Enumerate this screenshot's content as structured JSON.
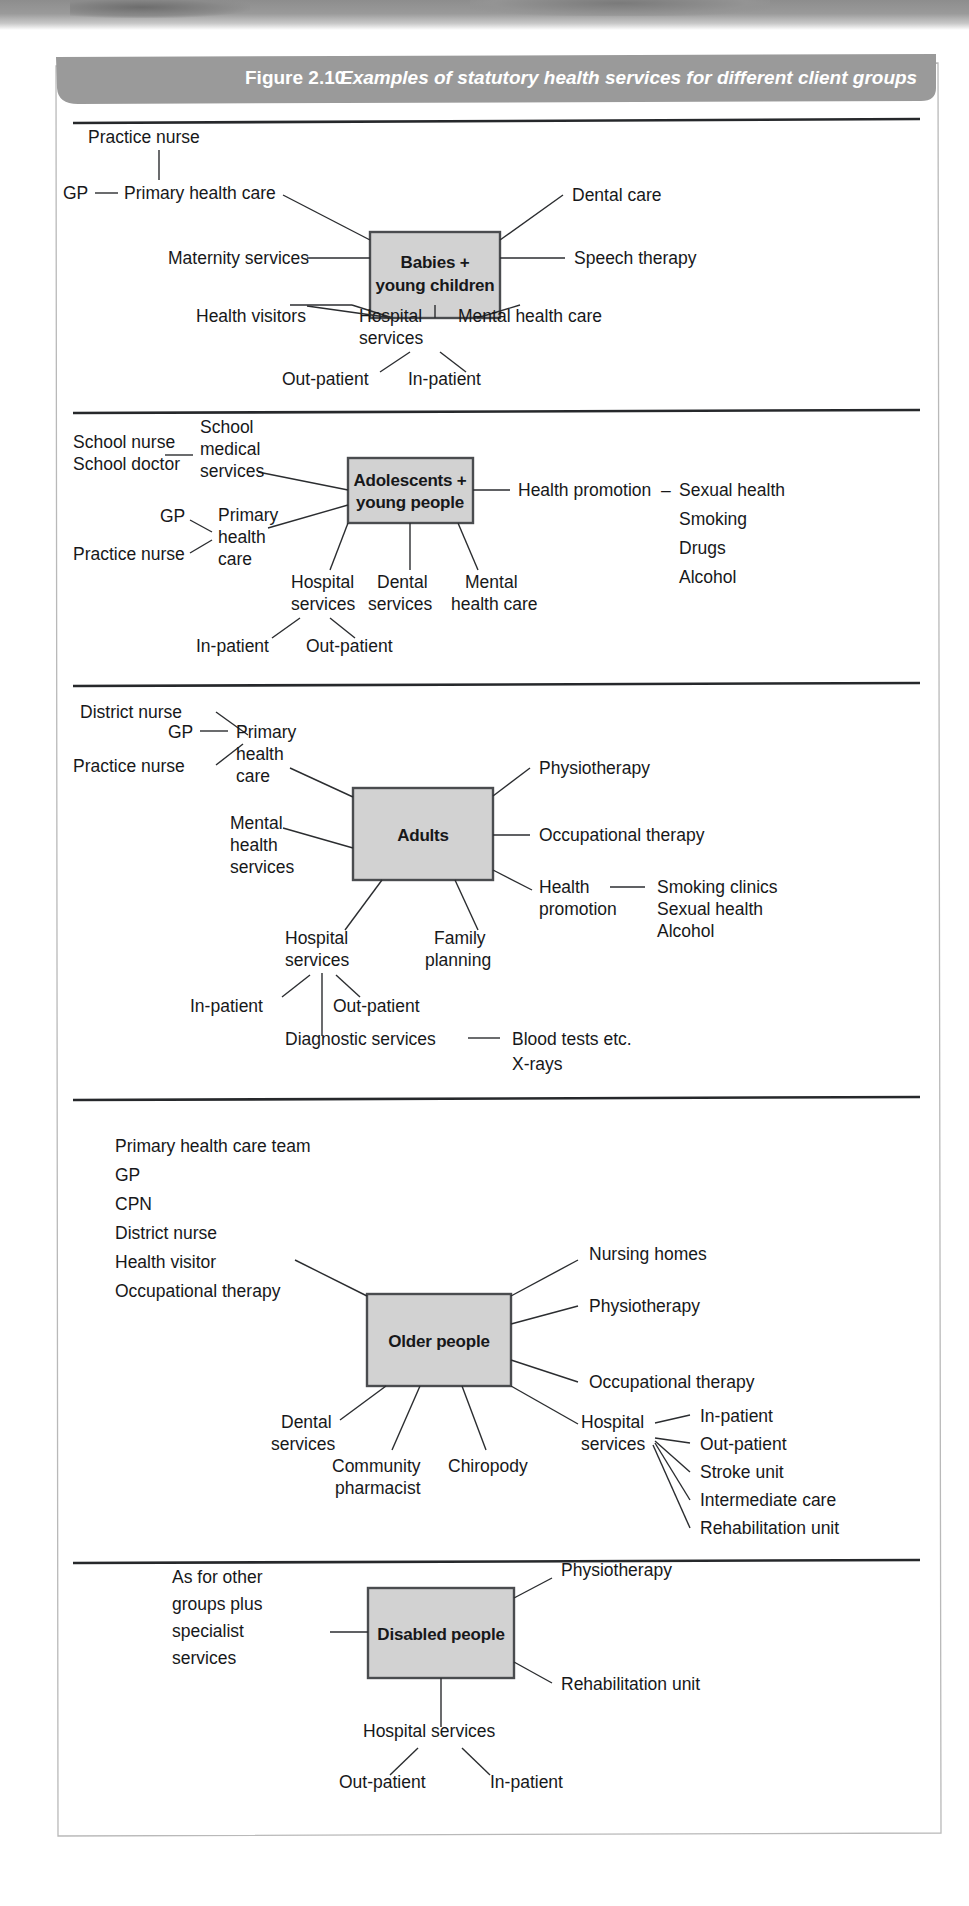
{
  "figure": {
    "number": "Figure 2.10",
    "title": "Examples of statutory health services for different client groups"
  },
  "colors": {
    "banner": "#9a9a9a",
    "box_fill": "#d2d2d2",
    "box_stroke": "#4a4c4f",
    "line": "#2b2d30",
    "rule": "#26282b",
    "page_border": "#b9b9b9"
  },
  "sections": [
    {
      "id": "babies",
      "center": "Babies +\nyoung children",
      "center_line1": "Babies +",
      "center_line2": "young children",
      "labels": {
        "practice_nurse": "Practice nurse",
        "gp": "GP",
        "primary_health_care": "Primary health care",
        "maternity_services": "Maternity services",
        "dental_care": "Dental care",
        "speech_therapy": "Speech therapy",
        "health_visitors": "Health visitors",
        "hospital_services_l1": "Hospital",
        "hospital_services_l2": "services",
        "mental_health_care": "Mental health care",
        "out_patient": "Out-patient",
        "in_patient": "In-patient"
      }
    },
    {
      "id": "adolescents",
      "center_line1": "Adolescents +",
      "center_line2": "young people",
      "labels": {
        "school_nurse": "School nurse",
        "school_doctor": "School doctor",
        "school_medical_l1": "School",
        "school_medical_l2": "medical",
        "school_medical_l3": "services",
        "gp": "GP",
        "practice_nurse": "Practice nurse",
        "primary_l1": "Primary",
        "primary_l2": "health",
        "primary_l3": "care",
        "health_promotion": "Health promotion",
        "dash": "–",
        "sexual_health": "Sexual health",
        "smoking": "Smoking",
        "drugs": "Drugs",
        "alcohol": "Alcohol",
        "hospital_l1": "Hospital",
        "hospital_l2": "services",
        "dental_l1": "Dental",
        "dental_l2": "services",
        "mental_l1": "Mental",
        "mental_l2": "health care",
        "in_patient": "In-patient",
        "out_patient": "Out-patient"
      }
    },
    {
      "id": "adults",
      "center_line1": "Adults",
      "labels": {
        "district_nurse": "District nurse",
        "gp": "GP",
        "practice_nurse": "Practice nurse",
        "primary_l1": "Primary",
        "primary_l2": "health",
        "primary_l3": "care",
        "mental_l1": "Mental",
        "mental_l2": "health",
        "mental_l3": "services",
        "physiotherapy": "Physiotherapy",
        "occupational_therapy": "Occupational therapy",
        "health_promotion_l1": "Health",
        "health_promotion_l2": "promotion",
        "smoking_clinics": "Smoking clinics",
        "sexual_health": "Sexual health",
        "alcohol": "Alcohol",
        "hospital_l1": "Hospital",
        "hospital_l2": "services",
        "family_l1": "Family",
        "family_l2": "planning",
        "in_patient": "In-patient",
        "out_patient": "Out-patient",
        "diagnostic_services": "Diagnostic services",
        "blood_tests": "Blood tests etc.",
        "x_rays": "X-rays"
      }
    },
    {
      "id": "older",
      "center_line1": "Older people",
      "labels": {
        "primary_health_care_team": "Primary health care team",
        "gp": "GP",
        "cpn": "CPN",
        "district_nurse": "District nurse",
        "health_visitor": "Health visitor",
        "occupational_therapy_left": "Occupational therapy",
        "nursing_homes": "Nursing homes",
        "physiotherapy": "Physiotherapy",
        "occupational_therapy_right": "Occupational therapy",
        "dental_l1": "Dental",
        "dental_l2": "services",
        "community_l1": "Community",
        "community_l2": "pharmacist",
        "chiropody": "Chiropody",
        "hospital_l1": "Hospital",
        "hospital_l2": "services",
        "in_patient": "In-patient",
        "out_patient": "Out-patient",
        "stroke_unit": "Stroke unit",
        "intermediate_care": "Intermediate care",
        "rehabilitation_unit": "Rehabilitation unit"
      }
    },
    {
      "id": "disabled",
      "center_line1": "Disabled people",
      "labels": {
        "as_for_other_l1": "As for other",
        "as_for_other_l2": "groups plus",
        "as_for_other_l3": "specialist",
        "as_for_other_l4": "services",
        "physiotherapy": "Physiotherapy",
        "rehabilitation_unit": "Rehabilitation unit",
        "hospital_services": "Hospital services",
        "out_patient": "Out-patient",
        "in_patient": "In-patient"
      }
    }
  ]
}
